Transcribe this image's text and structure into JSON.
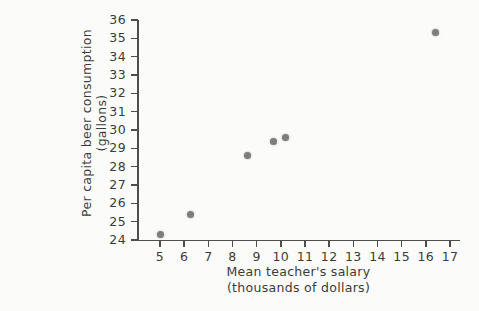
{
  "chart_data": {
    "type": "scatter",
    "title": "",
    "xlabel": "Mean teacher's salary",
    "xlabel_line2": "(thousands of dollars)",
    "ylabel": "Per capita beer consumption",
    "ylabel_line2": "(gallons)",
    "xlim": [
      5,
      17
    ],
    "ylim": [
      24,
      36
    ],
    "grid": false,
    "legend": "none",
    "xticks": [
      5,
      6,
      7,
      8,
      9,
      10,
      11,
      12,
      13,
      14,
      15,
      16,
      17
    ],
    "yticks": [
      24,
      25,
      26,
      27,
      28,
      29,
      30,
      31,
      32,
      33,
      34,
      35,
      36
    ],
    "x": [
      5.0,
      6.25,
      8.6,
      9.7,
      10.2,
      16.4
    ],
    "y": [
      24.3,
      25.4,
      28.6,
      29.4,
      29.6,
      35.3
    ],
    "points": [
      {
        "x": 5.0,
        "y": 24.3
      },
      {
        "x": 6.25,
        "y": 25.4
      },
      {
        "x": 8.6,
        "y": 28.6
      },
      {
        "x": 9.7,
        "y": 29.4
      },
      {
        "x": 10.2,
        "y": 29.6
      },
      {
        "x": 16.4,
        "y": 35.3
      }
    ],
    "marker_color": "#7d7d7d",
    "axis_color": "#4d4d4d",
    "background_color": "#fbfbfa"
  }
}
